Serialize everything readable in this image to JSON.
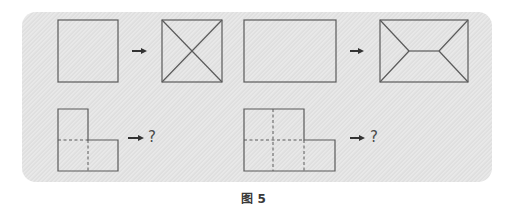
{
  "figure": {
    "caption": "图 5",
    "panel_color": "#e3e3e3",
    "stroke_color": "#5a5a5a"
  },
  "examples": [
    {
      "input": "square",
      "output": "square with both diagonals (X)"
    },
    {
      "input": "rectangle",
      "output": "rectangle with envelope/hip-roof lines"
    }
  ],
  "questions": [
    {
      "input": "L-shape of 3 unit squares with dashed fold lines",
      "output_label": "?"
    },
    {
      "input": "L-shape of 6 unit squares (2x2 block + right extension) with dashed fold lines",
      "output_label": "?"
    }
  ],
  "icons": {
    "arrow": "right-arrow-icon"
  }
}
